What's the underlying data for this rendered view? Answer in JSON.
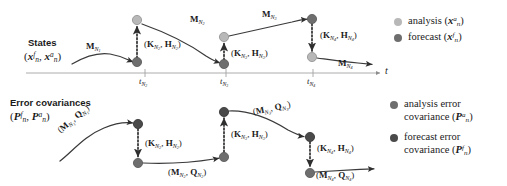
{
  "figure": {
    "type": "data-assimilation-cycle-diagram",
    "background": "#ffffff",
    "colors": {
      "analysis": "#b8b8b8",
      "forecast": "#6e6e6e",
      "analysis_error_cov": "#6e6e6e",
      "forecast_error_cov": "#4a4a4a",
      "line": "#3a3a3a",
      "axis": "#9a9a9a",
      "text": "#1a1a1a"
    }
  },
  "panels": {
    "states": {
      "title": "States",
      "subtitle_parts": {
        "open": "(",
        "forecast": "x",
        "forecast_sup": "f",
        "sub": "n",
        "comma": ", ",
        "analysis": "x",
        "analysis_sup": "a",
        "close": ")"
      },
      "subtitle_plain": "(x_n^f, x_n^a)"
    },
    "error_covariances": {
      "title": "Error covariances",
      "subtitle_plain": "(P_n^f, P_n^a)"
    }
  },
  "axis": {
    "label": "t",
    "ticks": [
      {
        "id": "tN2",
        "base": "t",
        "sub": "N",
        "subsub": "2",
        "x": 145
      },
      {
        "id": "tN3",
        "base": "t",
        "sub": "N",
        "subsub": "3",
        "x": 226
      },
      {
        "id": "tN4",
        "base": "t",
        "sub": "N",
        "subsub": "4",
        "x": 313
      }
    ]
  },
  "states_operators": {
    "propagators": [
      {
        "id": "MN1",
        "symbol": "M",
        "sub": "N",
        "subsub": "1",
        "x": 86,
        "y": 42
      },
      {
        "id": "MN2",
        "symbol": "M",
        "sub": "N",
        "subsub": "2",
        "x": 190,
        "y": 15
      },
      {
        "id": "MN3",
        "symbol": "M",
        "sub": "N",
        "subsub": "3",
        "x": 262,
        "y": 10
      },
      {
        "id": "MN4",
        "symbol": "M",
        "sub": "N",
        "subsub": "4",
        "x": 338,
        "y": 59
      }
    ],
    "gains": [
      {
        "id": "KHN2",
        "k": "K",
        "h": "H",
        "sub": "N",
        "subsub": "2",
        "x": 144,
        "y": 40
      },
      {
        "id": "KHN3",
        "k": "K",
        "h": "H",
        "sub": "N",
        "subsub": "3",
        "x": 231,
        "y": 49
      },
      {
        "id": "KHN4",
        "k": "K",
        "h": "H",
        "sub": "N",
        "subsub": "4",
        "x": 320,
        "y": 31
      }
    ]
  },
  "cov_operators": {
    "propagators": [
      {
        "id": "MQN1",
        "m": "M",
        "q": "Q",
        "sub": "N",
        "subsub": "1",
        "x": 62,
        "y": 131,
        "rotate": -40
      },
      {
        "id": "MQN2",
        "m": "M",
        "q": "Q",
        "sub": "N",
        "subsub": "2",
        "x": 168,
        "y": 170,
        "rotate": 0
      },
      {
        "id": "MQN3",
        "m": "M",
        "q": "Q",
        "sub": "N",
        "subsub": "3",
        "x": 254,
        "y": 110,
        "rotate": -14
      },
      {
        "id": "MQN4",
        "m": "M",
        "q": "Q",
        "sub": "N",
        "subsub": "4",
        "x": 318,
        "y": 172,
        "rotate": 0
      }
    ],
    "gains": [
      {
        "id": "KHN2c",
        "k": "K",
        "h": "H",
        "sub": "N",
        "subsub": "2",
        "x": 145,
        "y": 143
      },
      {
        "id": "KHN3c",
        "k": "K",
        "h": "H",
        "sub": "N",
        "subsub": "3",
        "x": 231,
        "y": 134
      },
      {
        "id": "KHN4c",
        "k": "K",
        "h": "H",
        "sub": "N",
        "subsub": "4",
        "x": 318,
        "y": 147
      }
    ]
  },
  "nodes": {
    "states": [
      {
        "id": "a-N2",
        "kind": "analysis",
        "x": 137,
        "y": 20
      },
      {
        "id": "f-N2",
        "kind": "forecast",
        "x": 137,
        "y": 62
      },
      {
        "id": "a-N3",
        "kind": "analysis",
        "x": 224,
        "y": 37
      },
      {
        "id": "f-N3",
        "kind": "forecast",
        "x": 224,
        "y": 64
      },
      {
        "id": "f-N4",
        "kind": "forecast",
        "x": 312,
        "y": 19
      },
      {
        "id": "a-N4",
        "kind": "analysis",
        "x": 312,
        "y": 57
      }
    ],
    "covariances": [
      {
        "id": "Pf-N2",
        "kind": "forecast_error_cov",
        "x": 138,
        "y": 124
      },
      {
        "id": "Pa-N2",
        "kind": "analysis_error_cov",
        "x": 138,
        "y": 163
      },
      {
        "id": "Pf-N3",
        "kind": "forecast_error_cov",
        "x": 224,
        "y": 112
      },
      {
        "id": "Pa-N3",
        "kind": "analysis_error_cov",
        "x": 224,
        "y": 157
      },
      {
        "id": "Pf-N4",
        "kind": "forecast_error_cov",
        "x": 310,
        "y": 137
      },
      {
        "id": "Pa-N4",
        "kind": "analysis_error_cov",
        "x": 310,
        "y": 173
      }
    ]
  },
  "legend_states": {
    "items": [
      {
        "id": "analysis",
        "label": "analysis",
        "math_open": "(",
        "math_var": "x",
        "math_sup": "a",
        "math_sub": "n",
        "math_close": ")",
        "color": "#b8b8b8"
      },
      {
        "id": "forecast",
        "label": "forecast",
        "math_open": "(",
        "math_var": "x",
        "math_sup": "f",
        "math_sub": "n",
        "math_close": ")",
        "color": "#6e6e6e"
      }
    ]
  },
  "legend_cov": {
    "items": [
      {
        "id": "analysis-error-covariance",
        "line1": "analysis error",
        "line2": "covariance",
        "math_open": "(",
        "math_var": "P",
        "math_sup": "a",
        "math_sub": "n",
        "math_close": ")",
        "color": "#6e6e6e"
      },
      {
        "id": "forecast-error-covariance",
        "line1": "forecast error",
        "line2": "covariance",
        "math_open": "(",
        "math_var": "P",
        "math_sup": "f",
        "math_sub": "n",
        "math_close": ")",
        "color": "#4a4a4a"
      }
    ]
  }
}
